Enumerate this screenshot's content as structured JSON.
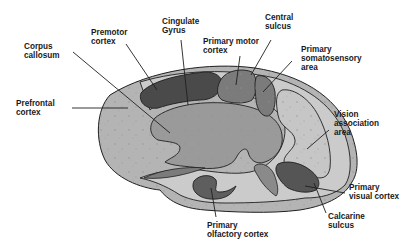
{
  "diagram": {
    "colors": {
      "hemisphere_fill": "#b4b4b4",
      "inner_band_fill": "#cbcbcb",
      "inner_region_fill": "#9a9a9a",
      "dark_region_fill": "#4a4a4a",
      "medium_region_fill": "#7b7b7b",
      "outline": "#1f1f1f",
      "leader_line": "#1f1f1f",
      "label_text": "#1a1a1a"
    },
    "labels": {
      "corpus_callosum": "Corpus\ncallosum",
      "premotor_cortex": "Premotor\ncortex",
      "cingulate_gyrus": "Cingulate\nGyrus",
      "central_sulcus": "Central\nsulcus",
      "primary_motor_cortex": "Primary motor\ncortex",
      "primary_somatosensory_area": "Primary\nsomatosensory\narea",
      "prefrontal_cortex": "Prefrontal\ncortex",
      "vision_association_area": "Vision\nassociation\narea",
      "primary_visual_cortex": "Primary\nvisual cortex",
      "calcarine_sulcus": "Calcarine\nsulcus",
      "primary_olfactory_cortex": "Primary\nolfactory cortex"
    }
  }
}
